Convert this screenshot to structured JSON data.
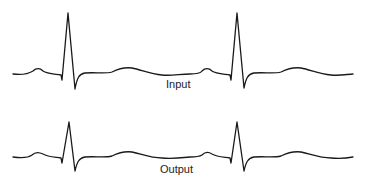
{
  "figure": {
    "stroke_color": "#1a1a1a",
    "background": "#ffffff"
  },
  "panels": [
    {
      "label": "Input",
      "beats": 2,
      "path": "M13,74 C20,75 28,74 33,71 C36,68 40,68 43,71 C47,74 55,74 61,75 L62,80 L68,13 L75,89 C77,78 79,74 85,73 C95,72 105,74 112,72 C118,69 124,67 132,68 C142,70 150,74 162,75 C172,76 180,74 190,74 C195,74 200,74 202,71 C205,68 209,68 212,71 C216,74 224,74 230,75 L231,80 L237,13 L244,88 C246,78 248,74 254,73 C264,72 274,74 281,72 C287,69 293,67 301,68 C311,70 319,74 331,75 C341,76 348,74 353,74"
    },
    {
      "label": "Output",
      "beats": 2,
      "path": "M13,157 C20,158 28,158 32,155 C35,152 39,152 43,154 C48,157 55,157 61,158 L62,163 L69,122 L75,171 C77,162 79,158 85,157 C95,156 104,158 112,156 C118,153 124,151 132,152 C142,154 150,158 162,158 C172,159 180,158 190,157 C195,157 199,157 202,155 C205,152 209,152 212,154 C217,157 224,157 230,158 L231,163 L237,122 L244,171 C246,162 248,158 254,157 C264,156 273,158 281,156 C287,153 293,151 301,152 C311,154 319,158 331,158 C341,159 348,158 353,157"
    }
  ]
}
